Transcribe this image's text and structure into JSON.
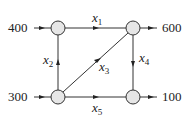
{
  "diagram": {
    "type": "network-flow",
    "nodes": [
      {
        "id": "A",
        "position": "top-left"
      },
      {
        "id": "B",
        "position": "top-right"
      },
      {
        "id": "C",
        "position": "bottom-left"
      },
      {
        "id": "D",
        "position": "bottom-right"
      }
    ],
    "external_flows": [
      {
        "node": "A",
        "direction": "in",
        "value": "400"
      },
      {
        "node": "B",
        "direction": "out",
        "value": "600"
      },
      {
        "node": "C",
        "direction": "in",
        "value": "300"
      },
      {
        "node": "D",
        "direction": "out",
        "value": "100"
      }
    ],
    "edges": [
      {
        "from": "A",
        "to": "B",
        "var": "x",
        "sub": "1"
      },
      {
        "from": "C",
        "to": "A",
        "var": "x",
        "sub": "2"
      },
      {
        "from": "C",
        "to": "B",
        "var": "x",
        "sub": "3"
      },
      {
        "from": "B",
        "to": "D",
        "var": "x",
        "sub": "4"
      },
      {
        "from": "C",
        "to": "D",
        "var": "x",
        "sub": "5"
      }
    ]
  }
}
